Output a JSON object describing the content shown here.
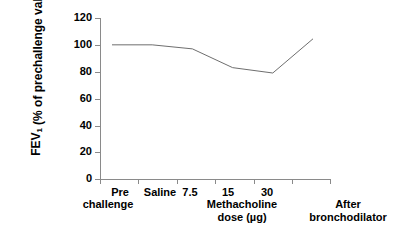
{
  "chart_data": {
    "type": "line",
    "title": "",
    "xlabel": "Methacholine dose (µg)",
    "ylabel": "FEV1 (% of prechallenge value)",
    "ylabel_line1": "FEV",
    "ylabel_line1_sub": "1",
    "ylabel_line2": "(% of prechallenge value)",
    "categories": [
      "Pre challenge",
      "Saline",
      "7.5",
      "15",
      "30",
      "After bronchodilator"
    ],
    "x_tick_labels": [
      "Pre",
      "Saline",
      "7.5",
      "15",
      "30",
      ""
    ],
    "x_tick_labels_line2": [
      "challenge",
      "",
      "",
      "",
      "",
      ""
    ],
    "x_group_label_line1": "Methacholine",
    "x_group_label_line2": "dose (µg)",
    "x_right_label_line1": "After",
    "x_right_label_line2": "bronchodilator",
    "values": [
      100,
      100,
      97,
      83,
      79,
      104.5
    ],
    "y_ticks": [
      0,
      20,
      40,
      60,
      80,
      100,
      120
    ],
    "ylim": [
      0,
      120
    ],
    "grid": false,
    "legend": "none",
    "series_color": "#6e6e6e",
    "axis_color": "#8a8a8a"
  },
  "axis": {
    "y_tick_labels": [
      "120",
      "100",
      "80",
      "60",
      "40",
      "20",
      "0"
    ]
  }
}
